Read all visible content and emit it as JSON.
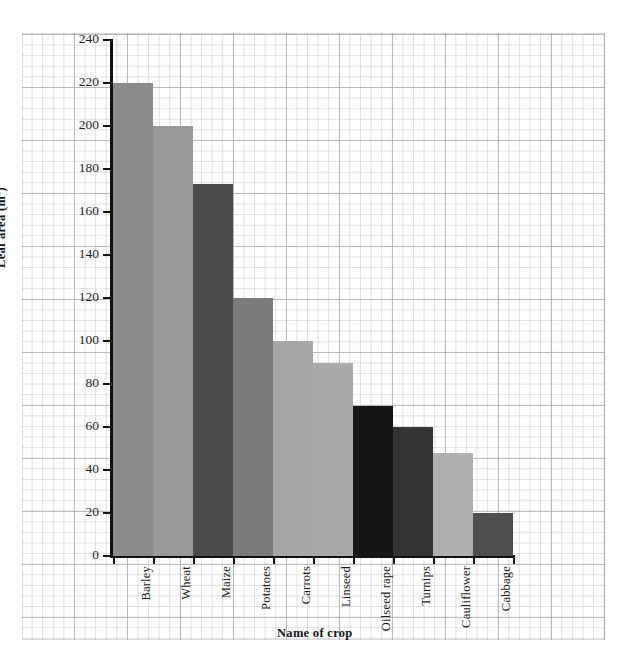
{
  "chart_data": {
    "type": "bar",
    "title": "",
    "subtitle": "",
    "xlabel": "Name of crop",
    "ylabel": "Leaf area (m²)",
    "ylabel_base": "Leaf area (m",
    "ylabel_sup": "2",
    "ylabel_close": ")",
    "ylim": [
      0,
      240
    ],
    "ytick_step": 20,
    "yticks": [
      0,
      20,
      40,
      60,
      80,
      100,
      120,
      140,
      160,
      180,
      200,
      220,
      240
    ],
    "ytick_labels": [
      "0",
      "20",
      "40",
      "60",
      "80",
      "100",
      "120",
      "140",
      "160",
      "180",
      "200",
      "220",
      "240"
    ],
    "grid": true,
    "grid_style": "graph-paper",
    "legend": "none",
    "categories": [
      "Barley",
      "Wheat",
      "Maize",
      "Potatoes",
      "Carrots",
      "Linseed",
      "Oilseed rape",
      "Turnips",
      "Cauliflower",
      "Cabbage"
    ],
    "values": [
      220,
      200,
      173,
      120,
      100,
      90,
      70,
      60,
      48,
      20
    ],
    "bar_colors": [
      "#8b8b8b",
      "#989898",
      "#4b4b4b",
      "#7a7a7a",
      "#a6a6a6",
      "#a8a8a8",
      "#151515",
      "#333333",
      "#b0b0b0",
      "#4e4e4e"
    ],
    "bars": [
      {
        "label": "Barley",
        "value": 220,
        "color": "#8b8b8b"
      },
      {
        "label": "Wheat",
        "value": 200,
        "color": "#989898"
      },
      {
        "label": "Maize",
        "value": 173,
        "color": "#4b4b4b"
      },
      {
        "label": "Potatoes",
        "value": 120,
        "color": "#7a7a7a"
      },
      {
        "label": "Carrots",
        "value": 100,
        "color": "#a6a6a6"
      },
      {
        "label": "Linseed",
        "value": 90,
        "color": "#a8a8a8"
      },
      {
        "label": "Oilseed rape",
        "value": 70,
        "color": "#151515"
      },
      {
        "label": "Turnips",
        "value": 60,
        "color": "#333333"
      },
      {
        "label": "Cauliflower",
        "value": 48,
        "color": "#b0b0b0"
      },
      {
        "label": "Cabbage",
        "value": 20,
        "color": "#4e4e4e"
      }
    ]
  },
  "style": {
    "background": "#ffffff",
    "axis_color": "#111111",
    "grid_major_color": "#96969b",
    "grid_minor_color": "#b7babe",
    "text_color": "#1a1a1a"
  }
}
